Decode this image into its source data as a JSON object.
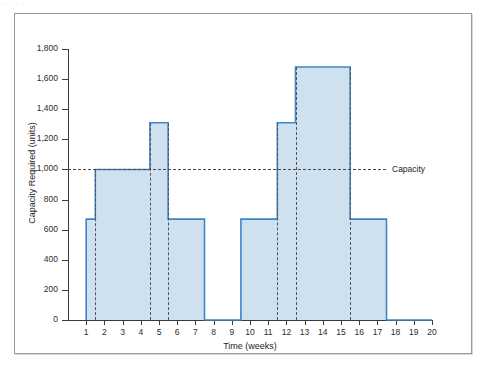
{
  "figure": {
    "caption_remnant": "· · · · ·"
  },
  "chart_data": {
    "type": "area",
    "title": "",
    "xlabel": "Time (weeks)",
    "ylabel": "Capacity Required (units)",
    "xlim": [
      0,
      20
    ],
    "ylim": [
      0,
      1800
    ],
    "ytick_step": 200,
    "grid": false,
    "legend": "none",
    "xticks": [
      1,
      2,
      3,
      4,
      5,
      6,
      7,
      8,
      9,
      10,
      11,
      12,
      13,
      14,
      15,
      16,
      17,
      18,
      19,
      20
    ],
    "yticks": [
      0,
      200,
      400,
      600,
      800,
      1000,
      1200,
      1400,
      1600,
      1800
    ],
    "ytick_labels": [
      "0",
      "200",
      "400",
      "600",
      "800",
      "1,000",
      "1,200",
      "1,400",
      "1,600",
      "1,800"
    ],
    "series": [
      {
        "name": "Capacity Required",
        "style": "step",
        "line_color": "#3d87c9",
        "fill_color": "#cfe0ee",
        "steps": [
          {
            "start": 1.0,
            "end": 1.5,
            "value": 670
          },
          {
            "start": 1.5,
            "end": 4.5,
            "value": 1000
          },
          {
            "start": 4.5,
            "end": 5.5,
            "value": 1310
          },
          {
            "start": 5.5,
            "end": 7.5,
            "value": 670
          },
          {
            "start": 7.5,
            "end": 9.5,
            "value": 0
          },
          {
            "start": 9.5,
            "end": 11.5,
            "value": 670
          },
          {
            "start": 11.5,
            "end": 12.5,
            "value": 1310
          },
          {
            "start": 12.5,
            "end": 15.5,
            "value": 1680
          },
          {
            "start": 15.5,
            "end": 17.5,
            "value": 670
          },
          {
            "start": 17.5,
            "end": 20.0,
            "value": 0
          }
        ]
      }
    ],
    "reference_lines": [
      {
        "name": "Capacity",
        "axis": "y",
        "value": 1000,
        "label": "Capacity",
        "style": "dashed"
      }
    ],
    "vertical_markers": [
      1.5,
      4.5,
      5.5,
      11.5,
      12.5,
      15.5
    ]
  }
}
